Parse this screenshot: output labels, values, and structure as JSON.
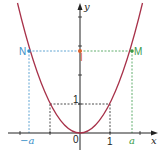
{
  "diagram": {
    "title": "",
    "function": "y = x^2",
    "axes": {
      "x_label": "x",
      "y_label": "y",
      "origin_label": "0"
    },
    "ticks": {
      "x_one": "1",
      "y_one": "1",
      "x_a": "a",
      "x_neg_a": "−a"
    },
    "points": {
      "N": {
        "label": "N",
        "color": "#3a8fc8"
      },
      "M": {
        "label": "M",
        "color": "#3a9a4a"
      },
      "I": {
        "label": "I",
        "color": "#e0602a"
      }
    },
    "colors": {
      "curve": "#a8324a",
      "axis": "#222222",
      "dash_black": "#222222",
      "dash_blue": "#3a8fc8",
      "dash_green": "#3a9a4a"
    }
  }
}
